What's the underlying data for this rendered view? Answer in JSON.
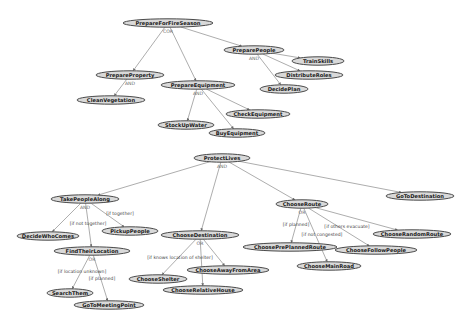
{
  "diagram": {
    "type": "goal-tree",
    "colors": {
      "background": "#ffffff",
      "node_fill": "#d9d9d9",
      "node_stroke": "#4a4a4a",
      "edge": "#8a8a8a",
      "operator_text": "#6a6a6a"
    },
    "nodes": [
      {
        "id": "PrepareForFireSeason",
        "label": "PrepareForFireSeason",
        "x": 168,
        "y": 23,
        "w": 90,
        "op": "COR"
      },
      {
        "id": "PreparePeople",
        "label": "PreparePeople",
        "x": 254,
        "y": 50,
        "w": 60,
        "op": "AND"
      },
      {
        "id": "PrepareProperty",
        "label": "PrepareProperty",
        "x": 130,
        "y": 75,
        "w": 68,
        "op": "AND"
      },
      {
        "id": "PrepareEquipment",
        "label": "PrepareEquipment",
        "x": 198,
        "y": 85,
        "w": 74,
        "op": "AND"
      },
      {
        "id": "CleanVegetation",
        "label": "CleanVegetation",
        "x": 111,
        "y": 100,
        "w": 68
      },
      {
        "id": "TrainSkills",
        "label": "TrainSkills",
        "x": 318,
        "y": 61,
        "w": 52
      },
      {
        "id": "DistributeRoles",
        "label": "DistributeRoles",
        "x": 309,
        "y": 75,
        "w": 68
      },
      {
        "id": "DecidePlan",
        "label": "DecidePlan",
        "x": 284,
        "y": 89,
        "w": 48
      },
      {
        "id": "CheckEquipment",
        "label": "CheckEquipment",
        "x": 258,
        "y": 114,
        "w": 64
      },
      {
        "id": "StockUpWater",
        "label": "StockUpWater",
        "x": 186,
        "y": 125,
        "w": 56
      },
      {
        "id": "BuyEquipment",
        "label": "BuyEquipment",
        "x": 237,
        "y": 133,
        "w": 56
      },
      {
        "id": "ProtectLives",
        "label": "ProtectLives",
        "x": 222,
        "y": 158,
        "w": 56,
        "op": "AND"
      },
      {
        "id": "TakePeopleAlong",
        "label": "TakePeopleAlong",
        "x": 85,
        "y": 199,
        "w": 68,
        "op": "AND"
      },
      {
        "id": "ChooseDestination",
        "label": "ChooseDestination",
        "x": 200,
        "y": 235,
        "w": 78,
        "op": "OR"
      },
      {
        "id": "ChooseRoute",
        "label": "ChooseRoute",
        "x": 302,
        "y": 204,
        "w": 52,
        "op": "OR"
      },
      {
        "id": "GoToDestination",
        "label": "GoToDestination",
        "x": 420,
        "y": 196,
        "w": 68
      },
      {
        "id": "DecideWhoComes",
        "label": "DecideWhoComes",
        "x": 48,
        "y": 236,
        "w": 62
      },
      {
        "id": "PickupPeople",
        "label": "PickupPeople",
        "x": 130,
        "y": 231,
        "w": 56
      },
      {
        "id": "FindTheirLocation",
        "label": "FindTheirLocation",
        "x": 92,
        "y": 251,
        "w": 76,
        "op": "OR"
      },
      {
        "id": "ChooseAwayFromArea",
        "label": "ChooseAwayFromArea",
        "x": 228,
        "y": 270,
        "w": 82
      },
      {
        "id": "ChooseShelter",
        "label": "ChooseShelter",
        "x": 158,
        "y": 279,
        "w": 58
      },
      {
        "id": "ChooseRelativeHouse",
        "label": "ChooseRelativeHouse",
        "x": 203,
        "y": 290,
        "w": 80
      },
      {
        "id": "ChoosePrePlannedRoute",
        "label": "ChoosePrePlannedRoute",
        "x": 290,
        "y": 247,
        "w": 94
      },
      {
        "id": "ChooseFollowPeople",
        "label": "ChooseFollowPeople",
        "x": 376,
        "y": 250,
        "w": 82
      },
      {
        "id": "ChooseRandomRoute",
        "label": "ChooseRandomRoute",
        "x": 412,
        "y": 234,
        "w": 78
      },
      {
        "id": "ChooseMainRoad",
        "label": "ChooseMainRoad",
        "x": 329,
        "y": 266,
        "w": 64
      },
      {
        "id": "SearchThem",
        "label": "SearchThem",
        "x": 70,
        "y": 293,
        "w": 46
      },
      {
        "id": "GoToMeetingPoint",
        "label": "GoToMeetingPoint",
        "x": 109,
        "y": 305,
        "w": 70
      }
    ],
    "edges": [
      {
        "from": "PrepareForFireSeason",
        "to": "PrepareProperty"
      },
      {
        "from": "PrepareForFireSeason",
        "to": "PrepareEquipment"
      },
      {
        "from": "PrepareForFireSeason",
        "to": "PreparePeople"
      },
      {
        "from": "PrepareProperty",
        "to": "CleanVegetation"
      },
      {
        "from": "PreparePeople",
        "to": "TrainSkills"
      },
      {
        "from": "PreparePeople",
        "to": "DistributeRoles"
      },
      {
        "from": "PreparePeople",
        "to": "DecidePlan"
      },
      {
        "from": "PrepareEquipment",
        "to": "StockUpWater"
      },
      {
        "from": "PrepareEquipment",
        "to": "BuyEquipment"
      },
      {
        "from": "PrepareEquipment",
        "to": "CheckEquipment"
      },
      {
        "from": "ProtectLives",
        "to": "TakePeopleAlong"
      },
      {
        "from": "ProtectLives",
        "to": "ChooseDestination"
      },
      {
        "from": "ProtectLives",
        "to": "ChooseRoute"
      },
      {
        "from": "ProtectLives",
        "to": "GoToDestination"
      },
      {
        "from": "TakePeopleAlong",
        "to": "DecideWhoComes"
      },
      {
        "from": "TakePeopleAlong",
        "to": "FindTheirLocation",
        "condition": "[if not together]"
      },
      {
        "from": "TakePeopleAlong",
        "to": "PickupPeople",
        "condition": "[if together]"
      },
      {
        "from": "FindTheirLocation",
        "to": "SearchThem",
        "condition": "[if location unknown]"
      },
      {
        "from": "FindTheirLocation",
        "to": "GoToMeetingPoint",
        "condition": "[if planned]"
      },
      {
        "from": "ChooseDestination",
        "to": "ChooseShelter",
        "condition": "[if knows location of shelter]"
      },
      {
        "from": "ChooseDestination",
        "to": "ChooseRelativeHouse"
      },
      {
        "from": "ChooseDestination",
        "to": "ChooseAwayFromArea"
      },
      {
        "from": "ChooseRoute",
        "to": "ChoosePrePlannedRoute",
        "condition": "[if planned]"
      },
      {
        "from": "ChooseRoute",
        "to": "ChooseMainRoad",
        "condition": "[if not congested]"
      },
      {
        "from": "ChooseRoute",
        "to": "ChooseFollowPeople",
        "condition": "[if others evacuate]"
      },
      {
        "from": "ChooseRoute",
        "to": "ChooseRandomRoute"
      }
    ],
    "condition_labels": [
      {
        "text": "[if together]",
        "x": 120,
        "y": 215
      },
      {
        "text": "[if not together]",
        "x": 88,
        "y": 225
      },
      {
        "text": "[if location unknown]",
        "x": 82,
        "y": 273
      },
      {
        "text": "[if planned]",
        "x": 102,
        "y": 280
      },
      {
        "text": "[if knows location of shelter]",
        "x": 180,
        "y": 259
      },
      {
        "text": "[if planned]",
        "x": 296,
        "y": 226
      },
      {
        "text": "[if not congested]",
        "x": 322,
        "y": 236
      },
      {
        "text": "[if others evacuate]",
        "x": 347,
        "y": 228
      }
    ]
  }
}
